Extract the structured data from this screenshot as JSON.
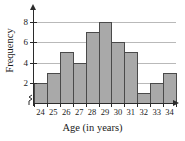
{
  "chart_data": {
    "type": "bar",
    "title": "",
    "xlabel": "Age (in years)",
    "ylabel": "Frequency",
    "categories": [
      "24",
      "25",
      "26",
      "27",
      "28",
      "29",
      "30",
      "31",
      "32",
      "33",
      "34"
    ],
    "values": [
      2,
      3,
      5,
      4,
      7,
      8,
      6,
      5,
      1,
      2,
      3
    ],
    "xlim": [
      23.5,
      34.5
    ],
    "ylim": [
      0,
      9
    ],
    "yticks": [
      2,
      4,
      6,
      8
    ],
    "ytick_labels": [
      "2",
      "4",
      "6",
      "8"
    ],
    "xtick_labels": [
      "24",
      "25",
      "26",
      "27",
      "28",
      "29",
      "30",
      "31",
      "32",
      "33",
      "34"
    ],
    "grid": true,
    "grid_axis": "y",
    "legend": null,
    "bar_fill_color": "#a9a9a9",
    "bar_edge_color": "#4a4a4a",
    "axis_color": "#2b2b2b",
    "gridline_color": "#b9b9b9",
    "has_axis_break": true,
    "axis_arrows": true
  }
}
